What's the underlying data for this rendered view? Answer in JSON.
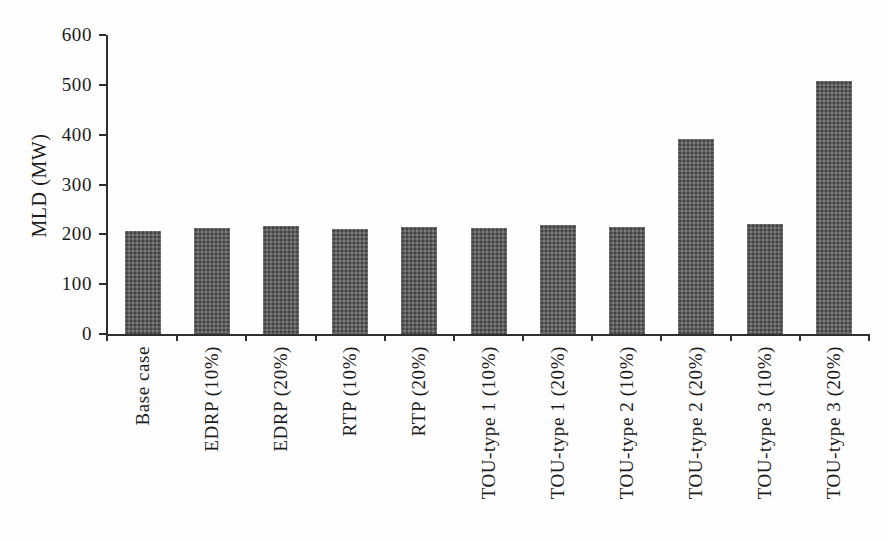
{
  "chart_data": {
    "type": "bar",
    "title": "",
    "xlabel": "",
    "ylabel": "MLD (MW)",
    "categories": [
      "Base case",
      "EDRP (10%)",
      "EDRP (20%)",
      "RTP (10%)",
      "RTP (20%)",
      "TOU-type 1 (10%)",
      "TOU-type 1 (20%)",
      "TOU-type 2 (10%)",
      "TOU-type 2 (20%)",
      "TOU-type 3 (10%)",
      "TOU-type 3 (20%)"
    ],
    "values": [
      206,
      213,
      216,
      211,
      215,
      213,
      218,
      214,
      392,
      220,
      507
    ],
    "ylim": [
      0,
      600
    ],
    "yticks": [
      0,
      100,
      200,
      300,
      400,
      500,
      600
    ],
    "grid": false,
    "legend_position": "none",
    "bar_color": "#5d5d5d",
    "axis_color": "#2e2e2e",
    "text_color": "#1b1b1b",
    "background_color": "#fefefe"
  }
}
